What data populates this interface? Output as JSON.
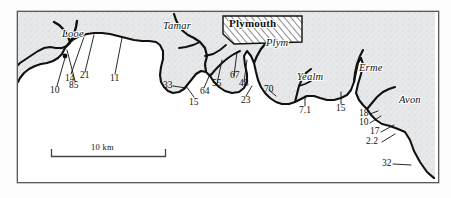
{
  "figure": {
    "kind": "coastal-map",
    "region": "South Devon / South-East Cornwall coast, England"
  },
  "map": {
    "city": {
      "name": "Plymouth"
    },
    "rivers": [
      {
        "name": "Looe"
      },
      {
        "name": "Tamar"
      },
      {
        "name": "Plym"
      },
      {
        "name": "Yealm"
      },
      {
        "name": "Erme"
      },
      {
        "name": "Avon"
      }
    ],
    "values": [
      {
        "label": "14"
      },
      {
        "label": "21"
      },
      {
        "label": "11"
      },
      {
        "label": "10"
      },
      {
        "label": "85"
      },
      {
        "label": "33"
      },
      {
        "label": "64"
      },
      {
        "label": "15"
      },
      {
        "label": "55"
      },
      {
        "label": "67"
      },
      {
        "label": "48"
      },
      {
        "label": "23"
      },
      {
        "label": "70"
      },
      {
        "label": "7.1"
      },
      {
        "label": "15"
      },
      {
        "label": "18"
      },
      {
        "label": "10"
      },
      {
        "label": "17"
      },
      {
        "label": "2.2"
      },
      {
        "label": "32"
      }
    ],
    "scale_bar": {
      "label": "10 km"
    },
    "colors": {
      "land": "#e3e5e8",
      "sea": "#ffffff",
      "coastline": "#111111",
      "frame": "#5a5a5a",
      "hatch": "#2b2b2b"
    }
  }
}
